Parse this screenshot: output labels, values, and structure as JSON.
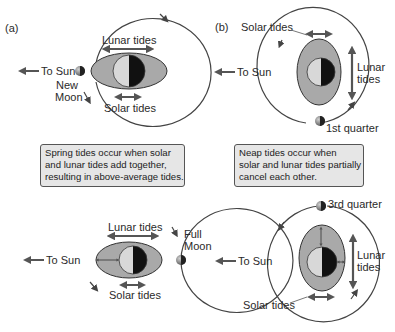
{
  "figure": {
    "panel_a": {
      "label": "(a)",
      "top": {
        "lunar_tides": "Lunar tides",
        "solar_tides": "Solar tides",
        "to_sun": "To Sun",
        "moon_label_line1": "New",
        "moon_label_line2": "Moon"
      },
      "callout": {
        "line1": "Spring tides occur when solar",
        "line2": "and lunar tides add together,",
        "line3": "resulting in above-average tides."
      },
      "bottom": {
        "lunar_tides": "Lunar tides",
        "solar_tides": "Solar tides",
        "to_sun": "To Sun",
        "moon_label_line1": "Full",
        "moon_label_line2": "Moon"
      }
    },
    "panel_b": {
      "label": "(b)",
      "top": {
        "solar_tides": "Solar tides",
        "lunar_tides_line1": "Lunar",
        "lunar_tides_line2": "tides",
        "to_sun": "To Sun",
        "moon_label": "1st quarter"
      },
      "callout": {
        "line1": "Neap tides occur when",
        "line2": "solar and lunar tides partially",
        "line3": "cancel each other."
      },
      "bottom": {
        "solar_tides": "Solar tides",
        "lunar_tides_line1": "Lunar",
        "lunar_tides_line2": "tides",
        "to_sun": "To Sun",
        "moon_label": "3rd quarter"
      }
    },
    "colors": {
      "tidal_bulge": "#a9a9a9",
      "earth_day": "#d8d8d8",
      "earth_night": "#111111",
      "arrow": "#555555",
      "orbit": "#444444",
      "callout_bg": "#e6e6e6"
    }
  }
}
